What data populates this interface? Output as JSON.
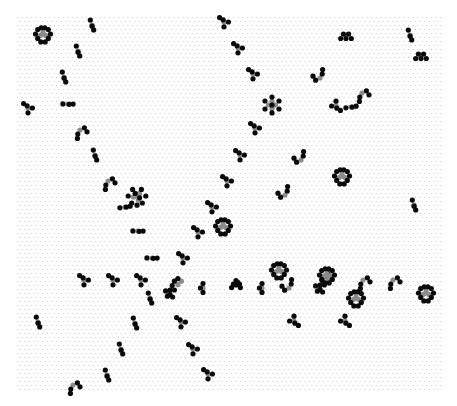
{
  "board": {
    "grid": {
      "x0": 17,
      "y0": 17,
      "x1": 441,
      "y1": 392,
      "dx": 4.6,
      "dy": 4.0,
      "dot_color": "#c8c8c8"
    },
    "colors": {
      "alive": "#0a0a0a",
      "dying": "#8c8c8c"
    },
    "cell_radius": 2.6,
    "patterns": [
      {
        "type": "ring",
        "x": 43,
        "y": 34
      },
      {
        "type": "pair",
        "x": 92,
        "y": 25,
        "angle": 40
      },
      {
        "type": "pair",
        "x": 78,
        "y": 51,
        "angle": 40
      },
      {
        "type": "pair",
        "x": 64,
        "y": 77,
        "angle": 40
      },
      {
        "type": "tri",
        "x": 28,
        "y": 108,
        "angle": 0
      },
      {
        "type": "pair",
        "x": 68,
        "y": 104,
        "angle": -30
      },
      {
        "type": "hook",
        "x": 80,
        "y": 130,
        "angle": 0
      },
      {
        "type": "pair",
        "x": 95,
        "y": 155,
        "angle": 40
      },
      {
        "type": "hook",
        "x": 108,
        "y": 181,
        "angle": 0
      },
      {
        "type": "flower",
        "x": 137,
        "y": 196
      },
      {
        "type": "pair",
        "x": 125,
        "y": 207,
        "angle": -40
      },
      {
        "type": "pair",
        "x": 138,
        "y": 231,
        "angle": -30
      },
      {
        "type": "tri",
        "x": 224,
        "y": 22,
        "angle": 0
      },
      {
        "type": "tri",
        "x": 238,
        "y": 48,
        "angle": 0
      },
      {
        "type": "tri",
        "x": 253,
        "y": 74,
        "angle": 0
      },
      {
        "type": "flower6",
        "x": 272,
        "y": 105
      },
      {
        "type": "tri",
        "x": 255,
        "y": 128,
        "angle": 0
      },
      {
        "type": "tri",
        "x": 240,
        "y": 155,
        "angle": 0
      },
      {
        "type": "tri",
        "x": 227,
        "y": 181,
        "angle": 0
      },
      {
        "type": "tri",
        "x": 212,
        "y": 207,
        "angle": 0
      },
      {
        "type": "ring",
        "x": 223,
        "y": 226
      },
      {
        "type": "tri",
        "x": 198,
        "y": 232,
        "angle": 0
      },
      {
        "type": "tri",
        "x": 183,
        "y": 258,
        "angle": 0
      },
      {
        "type": "pair",
        "x": 152,
        "y": 258,
        "angle": -30
      },
      {
        "type": "tri",
        "x": 84,
        "y": 280,
        "angle": 0
      },
      {
        "type": "tri",
        "x": 113,
        "y": 280,
        "angle": 0
      },
      {
        "type": "tri",
        "x": 141,
        "y": 280,
        "angle": 0
      },
      {
        "type": "pair",
        "x": 150,
        "y": 298,
        "angle": 40
      },
      {
        "type": "clump",
        "x": 170,
        "y": 290
      },
      {
        "type": "bar",
        "x": 203,
        "y": 288
      },
      {
        "type": "clump2",
        "x": 236,
        "y": 285
      },
      {
        "type": "bar",
        "x": 262,
        "y": 288
      },
      {
        "type": "ring",
        "x": 279,
        "y": 270
      },
      {
        "type": "hook",
        "x": 289,
        "y": 288,
        "angle": 180
      },
      {
        "type": "clump",
        "x": 320,
        "y": 285
      },
      {
        "type": "ring",
        "x": 327,
        "y": 275
      },
      {
        "type": "hook",
        "x": 363,
        "y": 280,
        "angle": 0
      },
      {
        "type": "hook",
        "x": 393,
        "y": 280,
        "angle": 0
      },
      {
        "type": "ring",
        "x": 356,
        "y": 298
      },
      {
        "type": "ring",
        "x": 426,
        "y": 293
      },
      {
        "type": "cap",
        "x": 346,
        "y": 35
      },
      {
        "type": "pair",
        "x": 410,
        "y": 35,
        "angle": 40
      },
      {
        "type": "cap",
        "x": 421,
        "y": 55
      },
      {
        "type": "hook",
        "x": 320,
        "y": 78,
        "angle": 180
      },
      {
        "type": "hook",
        "x": 362,
        "y": 93,
        "angle": 0
      },
      {
        "type": "tri",
        "x": 336,
        "y": 106,
        "angle": 180
      },
      {
        "type": "pair",
        "x": 351,
        "y": 107,
        "angle": -40
      },
      {
        "type": "hook",
        "x": 301,
        "y": 160,
        "angle": 180
      },
      {
        "type": "ring",
        "x": 342,
        "y": 176
      },
      {
        "type": "hook",
        "x": 285,
        "y": 195,
        "angle": 180
      },
      {
        "type": "pair",
        "x": 414,
        "y": 205,
        "angle": 40
      },
      {
        "type": "pair",
        "x": 38,
        "y": 322,
        "angle": 40
      },
      {
        "type": "pair",
        "x": 135,
        "y": 323,
        "angle": 40
      },
      {
        "type": "tri",
        "x": 181,
        "y": 322,
        "angle": 0
      },
      {
        "type": "tri",
        "x": 294,
        "y": 321,
        "angle": 180
      },
      {
        "type": "tri",
        "x": 345,
        "y": 321,
        "angle": 180
      },
      {
        "type": "pair",
        "x": 121,
        "y": 349,
        "angle": 40
      },
      {
        "type": "tri",
        "x": 193,
        "y": 349,
        "angle": 0
      },
      {
        "type": "pair",
        "x": 107,
        "y": 375,
        "angle": 40
      },
      {
        "type": "tri",
        "x": 208,
        "y": 374,
        "angle": 0
      },
      {
        "type": "hook",
        "x": 73,
        "y": 385,
        "angle": 0
      }
    ]
  }
}
